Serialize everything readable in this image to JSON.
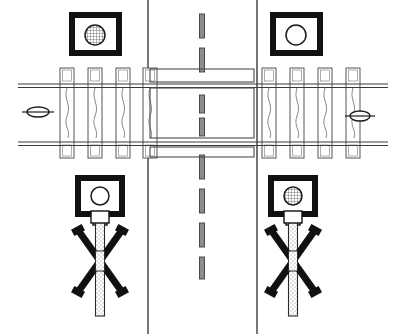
{
  "diagram": {
    "title": "Railroad Grade Crossing",
    "background_color": "#ffffff",
    "stroke_color": "#1a1a1a",
    "fill_light": "#ffffff",
    "width": 406,
    "height": 334
  },
  "road": {
    "name": "two-lane-road",
    "orientation": "vertical",
    "left_edge_x": 148,
    "right_edge_x": 257,
    "edge_color": "#2b2b2b",
    "centerline": {
      "name": "dashed-centerline",
      "x": 202,
      "style": "dashed",
      "dash_length": 22,
      "dash_gap": 14,
      "width": 5,
      "color": "#555555",
      "segments_above": [
        {
          "y": 14,
          "h": 24
        },
        {
          "y": 48,
          "h": 24
        }
      ],
      "segments_between": [
        {
          "y": 95,
          "h": 18
        },
        {
          "y": 118,
          "h": 18
        }
      ],
      "segments_below": [
        {
          "y": 155,
          "h": 24
        },
        {
          "y": 189,
          "h": 24
        },
        {
          "y": 223,
          "h": 24
        },
        {
          "y": 257,
          "h": 22
        }
      ]
    }
  },
  "track": {
    "name": "railroad-track",
    "orientation": "horizontal",
    "rail_top_y": 84,
    "rail_bottom_y": 142,
    "rail_gauge_px": 58,
    "rail_color": "#3a3a3a",
    "rail_line_width": 1,
    "tie_color": "#555555",
    "tie_width": 14,
    "tie_top_y": 68,
    "tie_bottom_y": 158,
    "ties_left_x": [
      60,
      88,
      116,
      143
    ],
    "ties_right_x": [
      262,
      290,
      318,
      346
    ],
    "tie_count": 8
  },
  "markers": {
    "left_train_marker": {
      "name": "train-marker-left",
      "shape": "oval-with-axle-line",
      "cx": 38,
      "cy": 112,
      "rx": 11,
      "ry": 5
    },
    "right_train_marker": {
      "name": "train-marker-right",
      "shape": "oval-with-axle-line",
      "cx": 360,
      "cy": 116,
      "rx": 10,
      "ry": 5
    }
  },
  "signals": [
    {
      "id": "signal-top-left",
      "name": "signal-box-top-left",
      "position": "top-left",
      "x": 69,
      "y": 12,
      "w": 53,
      "h": 44,
      "frame_color": "#111111",
      "frame_thickness": 6,
      "lamp": {
        "name": "lamp-indicator",
        "state": "on",
        "fill": "hatched",
        "cx": 95,
        "cy": 35,
        "r": 10
      },
      "has_mast": false
    },
    {
      "id": "signal-top-right",
      "name": "signal-box-top-right",
      "position": "top-right",
      "x": 270,
      "y": 12,
      "w": 53,
      "h": 44,
      "frame_color": "#111111",
      "frame_thickness": 6,
      "lamp": {
        "name": "lamp-indicator",
        "state": "off",
        "fill": "empty",
        "cx": 296,
        "cy": 35,
        "r": 10
      },
      "has_mast": false
    },
    {
      "id": "signal-bottom-left",
      "name": "signal-box-bottom-left",
      "position": "bottom-left",
      "x": 75,
      "y": 175,
      "w": 50,
      "h": 42,
      "frame_color": "#111111",
      "frame_thickness": 6,
      "lamp": {
        "name": "lamp-indicator",
        "state": "off",
        "fill": "empty",
        "cx": 100,
        "cy": 196,
        "r": 9
      },
      "has_mast": true
    },
    {
      "id": "signal-bottom-right",
      "name": "signal-box-bottom-right",
      "position": "bottom-right",
      "x": 268,
      "y": 175,
      "w": 50,
      "h": 42,
      "frame_color": "#111111",
      "frame_thickness": 6,
      "lamp": {
        "name": "lamp-indicator",
        "state": "on",
        "fill": "hatched",
        "cx": 293,
        "cy": 196,
        "r": 9
      },
      "has_mast": true
    }
  ],
  "crossbucks": [
    {
      "id": "crossbuck-left",
      "name": "crossbuck-sign-left",
      "post_cx": 100,
      "post_top_y": 217,
      "post_bottom_y": 316,
      "post_width": 9,
      "post_fill": "stippled",
      "collar": {
        "y": 211,
        "w": 18,
        "h": 12
      },
      "cross_cy": 261,
      "cross_half_w": 22,
      "cross_half_h": 31,
      "arm_thickness": 7,
      "color": "#111111"
    },
    {
      "id": "crossbuck-right",
      "name": "crossbuck-sign-right",
      "post_cx": 293,
      "post_top_y": 217,
      "post_bottom_y": 316,
      "post_width": 9,
      "post_fill": "stippled",
      "collar": {
        "y": 211,
        "w": 18,
        "h": 12
      },
      "cross_cy": 261,
      "cross_half_w": 22,
      "cross_half_h": 31,
      "arm_thickness": 7,
      "color": "#111111"
    }
  ],
  "crossing_surface": {
    "name": "crossing-deck",
    "x": 150,
    "y": 88,
    "w": 104,
    "h": 50,
    "stroke": "#4a4a4a"
  }
}
